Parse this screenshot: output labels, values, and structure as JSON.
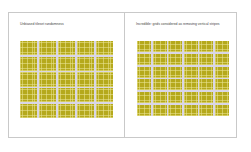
{
  "panels": [
    {
      "caption": "Unbiased tileset randomness",
      "grid": {
        "rows": 5,
        "cols": 5
      }
    },
    {
      "caption": "Incredible: grids considered as removing vertical stripes",
      "grid": {
        "rows": 6,
        "cols": 6
      }
    }
  ],
  "colors": {
    "tile": "#b5a91c",
    "grid_line": "#d9d6e6",
    "border": "#c9c9c9",
    "background": "#ffffff"
  }
}
